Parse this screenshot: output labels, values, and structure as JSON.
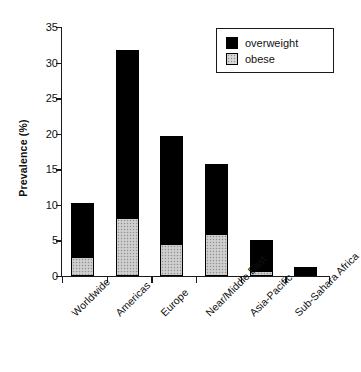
{
  "chart_data": {
    "type": "bar",
    "stacked": true,
    "title": "",
    "xlabel": "",
    "ylabel": "Prevalence (%)",
    "ylim": [
      0,
      35
    ],
    "yticks": [
      0,
      5,
      10,
      15,
      20,
      25,
      30,
      35
    ],
    "ytick_labels": [
      "0",
      "5",
      "10",
      "15",
      "20",
      "25",
      "30",
      "35"
    ],
    "grid": false,
    "legend_position": "top-right",
    "categories": [
      "Worldwide",
      "Americas",
      "Europe",
      "Near/Middle East",
      "Asia-Pacific",
      "Sub-Sahara Africa"
    ],
    "series": [
      {
        "name": "obese",
        "color": "#c6c6c6",
        "values": [
          2.6,
          8.0,
          4.4,
          5.8,
          0.6,
          0.0
        ]
      },
      {
        "name": "overweight",
        "color": "#000000",
        "values": [
          7.6,
          23.7,
          15.3,
          10.0,
          4.4,
          1.2
        ]
      }
    ],
    "totals": [
      10.2,
      31.7,
      19.7,
      15.8,
      5.0,
      1.2
    ]
  },
  "legend": {
    "entries": [
      {
        "label": "overweight",
        "swatch": "black-square-swatch"
      },
      {
        "label": "obese",
        "swatch": "gray-stipple-square-swatch"
      }
    ]
  }
}
